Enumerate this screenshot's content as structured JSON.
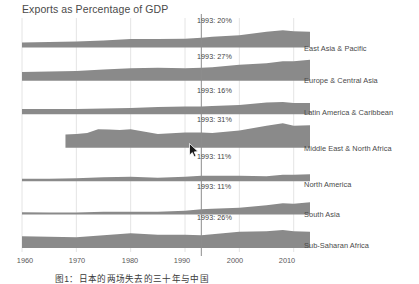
{
  "chart": {
    "title": "Exports as Percentage of GDP",
    "caption": "图1：日本的两场失去的三十年与中国",
    "marker_year_label": "1993",
    "band_color": "#8a8a8a",
    "gridline_color": "#e4e4e4",
    "marker_line_color": "#8d8d8d"
  },
  "axis": {
    "xticks": [
      "1960",
      "1970",
      "1980",
      "1990",
      "2000",
      "2010"
    ],
    "xlim": [
      1960,
      2013
    ]
  },
  "annotations": {
    "a0": "1993: 20%",
    "a1": "1993: 27%",
    "a2": "1993: 16%",
    "a3": "1993: 31%",
    "a4": "1993: 11%",
    "a5": "1993: 11%",
    "a6": "1993: 26%"
  },
  "regions": [
    {
      "label": "East Asia & Pacific"
    },
    {
      "label": "Europe & Central Asia"
    },
    {
      "label": "Latin America & Caribbean"
    },
    {
      "label": "Middle East & North Africa"
    },
    {
      "label": "North America"
    },
    {
      "label": "South Asia"
    },
    {
      "label": "Sub-Saharan Africa"
    }
  ],
  "chart_data": {
    "type": "area",
    "title": "Exports as Percentage of GDP",
    "xlabel": "",
    "ylabel": "Exports as Percentage of GDP",
    "xlim": [
      1960,
      2013
    ],
    "grid": true,
    "legend": "right-labels",
    "marker_year": 1993,
    "xticks": [
      1960,
      1970,
      1980,
      1990,
      2000,
      2010
    ],
    "value_at_marker_percent": [
      20,
      27,
      16,
      31,
      11,
      11,
      26
    ],
    "series": [
      {
        "name": "East Asia & Pacific",
        "marker_value": 20,
        "x": [
          1960,
          1965,
          1970,
          1975,
          1980,
          1985,
          1990,
          1993,
          1995,
          2000,
          2005,
          2008,
          2010,
          2013
        ],
        "values": [
          10,
          11,
          12,
          14,
          17,
          17,
          18,
          20,
          22,
          25,
          32,
          35,
          33,
          32
        ]
      },
      {
        "name": "Europe & Central Asia",
        "marker_value": 27,
        "x": [
          1960,
          1965,
          1970,
          1975,
          1980,
          1985,
          1990,
          1993,
          1995,
          2000,
          2005,
          2008,
          2010,
          2013
        ],
        "values": [
          18,
          19,
          20,
          23,
          26,
          27,
          26,
          27,
          28,
          33,
          36,
          40,
          40,
          43
        ]
      },
      {
        "name": "Latin America & Caribbean",
        "marker_value": 16,
        "x": [
          1960,
          1965,
          1970,
          1975,
          1980,
          1985,
          1990,
          1993,
          1995,
          2000,
          2005,
          2008,
          2010,
          2013
        ],
        "values": [
          11,
          11,
          11,
          12,
          13,
          15,
          16,
          16,
          17,
          19,
          24,
          25,
          23,
          23
        ]
      },
      {
        "name": "Middle East & North Africa",
        "marker_value": 31,
        "x": [
          1968,
          1970,
          1972,
          1974,
          1976,
          1978,
          1980,
          1985,
          1990,
          1993,
          1995,
          2000,
          2005,
          2008,
          2010,
          2013
        ],
        "values": [
          27,
          28,
          30,
          38,
          37,
          36,
          38,
          28,
          31,
          31,
          30,
          35,
          45,
          50,
          45,
          46
        ]
      },
      {
        "name": "North America",
        "marker_value": 11,
        "x": [
          1960,
          1965,
          1970,
          1975,
          1980,
          1985,
          1990,
          1993,
          1995,
          2000,
          2005,
          2008,
          2010,
          2013
        ],
        "values": [
          5,
          5,
          6,
          8,
          9,
          7,
          9,
          11,
          11,
          11,
          10,
          13,
          13,
          14
        ]
      },
      {
        "name": "South Asia",
        "marker_value": 11,
        "x": [
          1960,
          1965,
          1970,
          1975,
          1980,
          1985,
          1990,
          1993,
          1995,
          2000,
          2005,
          2008,
          2010,
          2013
        ],
        "values": [
          5,
          4,
          4,
          6,
          6,
          6,
          8,
          11,
          12,
          14,
          19,
          23,
          22,
          25
        ]
      },
      {
        "name": "Sub-Saharan Africa",
        "marker_value": 26,
        "x": [
          1960,
          1965,
          1970,
          1975,
          1980,
          1985,
          1990,
          1993,
          1995,
          2000,
          2005,
          2008,
          2010,
          2013
        ],
        "values": [
          24,
          23,
          22,
          26,
          30,
          27,
          27,
          26,
          28,
          33,
          34,
          37,
          34,
          33
        ]
      }
    ]
  }
}
